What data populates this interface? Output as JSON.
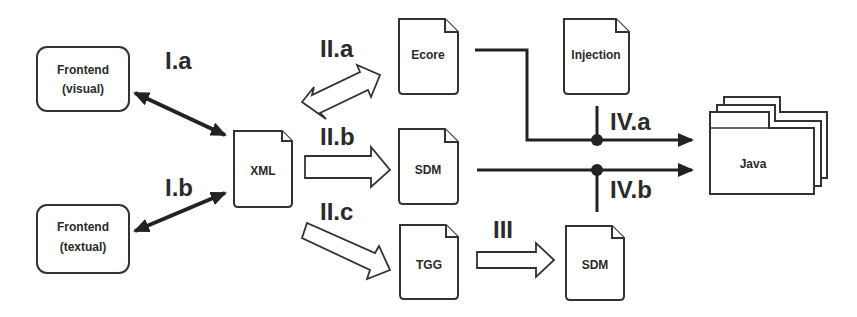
{
  "diagram": {
    "nodes": {
      "frontend_visual": {
        "line1": "Frontend",
        "line2": "(visual)"
      },
      "frontend_textual": {
        "line1": "Frontend",
        "line2": "(textual)"
      },
      "xml": {
        "label": "XML"
      },
      "ecore": {
        "label": "Ecore"
      },
      "injection": {
        "label": "Injection"
      },
      "sdm_top": {
        "label": "SDM"
      },
      "tgg": {
        "label": "TGG"
      },
      "sdm_bottom": {
        "label": "SDM"
      },
      "java": {
        "label": "Java"
      }
    },
    "edges": {
      "ia": {
        "label": "I.a"
      },
      "ib": {
        "label": "I.b"
      },
      "iia": {
        "label": "II.a"
      },
      "iib": {
        "label": "II.b"
      },
      "iic": {
        "label": "II.c"
      },
      "iii": {
        "label": "III"
      },
      "iva": {
        "label": "IV.a"
      },
      "ivb": {
        "label": "IV.b"
      }
    },
    "colors": {
      "stroke": "#333333",
      "background": "#ffffff"
    }
  }
}
